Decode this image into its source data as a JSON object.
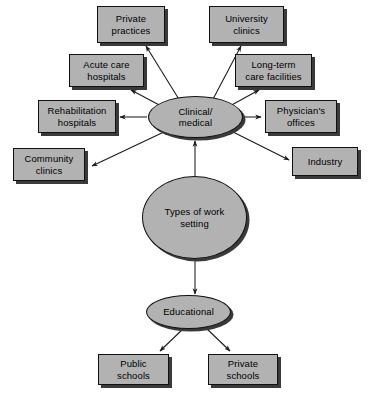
{
  "diagram": {
    "title": "Types of work setting",
    "type": "hierarchy-mind-map",
    "colors": {
      "node_fill": "#b2b2b2",
      "node_border": "#111111",
      "node_shadow": "#3a3a3a",
      "background": "#ffffff",
      "edge": "#1a1a1a",
      "text": "#000000"
    },
    "root": {
      "label": "Types of work\nsetting",
      "shape": "circle"
    },
    "branches": [
      {
        "id": "clinical-medical",
        "label": "Clinical/\nmedical",
        "shape": "ellipse",
        "children": [
          {
            "id": "private-practices",
            "label": "Private\npractices",
            "shape": "box"
          },
          {
            "id": "university-clinics",
            "label": "University\nclinics",
            "shape": "box"
          },
          {
            "id": "acute-care-hospitals",
            "label": "Acute care\nhospitals",
            "shape": "box"
          },
          {
            "id": "long-term-care-facilities",
            "label": "Long-term\ncare facilities",
            "shape": "box"
          },
          {
            "id": "rehabilitation-hospitals",
            "label": "Rehabilitation\nhospitals",
            "shape": "box"
          },
          {
            "id": "physicians-offices",
            "label": "Physician's\noffices",
            "shape": "box"
          },
          {
            "id": "community-clinics",
            "label": "Community\nclinics",
            "shape": "box"
          },
          {
            "id": "industry",
            "label": "Industry",
            "shape": "box"
          }
        ]
      },
      {
        "id": "educational",
        "label": "Educational",
        "shape": "ellipse",
        "children": [
          {
            "id": "public-schools",
            "label": "Public\nschools",
            "shape": "box"
          },
          {
            "id": "private-schools",
            "label": "Private\nschools",
            "shape": "box"
          }
        ]
      }
    ],
    "nodes": {
      "private_practices": "Private\npractices",
      "university_clinics": "University\nclinics",
      "acute_care_hospitals": "Acute care\nhospitals",
      "long_term_care_facilities": "Long-term\ncare facilities",
      "rehabilitation_hospitals": "Rehabilitation\nhospitals",
      "physicians_offices": "Physician's\noffices",
      "community_clinics": "Community\nclinics",
      "industry": "Industry",
      "clinical_medical": "Clinical/\nmedical",
      "types_of_work_setting": "Types of work\nsetting",
      "educational": "Educational",
      "public_schools": "Public\nschools",
      "private_schools": "Private\nschools"
    }
  }
}
